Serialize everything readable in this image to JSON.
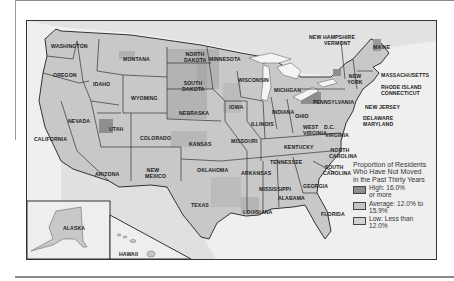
{
  "map": {
    "title": "Proportion of Residents Who Have Not Moved in the Past Thirty Years",
    "colors": {
      "water": "#f2f2f2",
      "land_outside": "#dcdcdc",
      "low": "#c8c8c8",
      "average": "#b4b4b4",
      "high": "#8e8e8e",
      "border": "#333333"
    },
    "states": [
      {
        "name": "WASHINGTON",
        "x": 50,
        "y": 43
      },
      {
        "name": "OREGON",
        "x": 52,
        "y": 71
      },
      {
        "name": "IDAHO",
        "x": 92,
        "y": 80
      },
      {
        "name": "MONTANA",
        "x": 122,
        "y": 55
      },
      {
        "name": "NORTH DAKOTA",
        "x": 183,
        "y": 50
      },
      {
        "name": "MINNESOTA",
        "x": 210,
        "y": 55
      },
      {
        "name": "SOUTH DAKOTA",
        "x": 182,
        "y": 79
      },
      {
        "name": "WYOMING",
        "x": 131,
        "y": 94
      },
      {
        "name": "NEBRASKA",
        "x": 178,
        "y": 109
      },
      {
        "name": "IOWA",
        "x": 228,
        "y": 103
      },
      {
        "name": "WISCONSIN",
        "x": 238,
        "y": 76
      },
      {
        "name": "MICHIGAN",
        "x": 274,
        "y": 86
      },
      {
        "name": "NEVADA",
        "x": 68,
        "y": 117
      },
      {
        "name": "UTAH",
        "x": 108,
        "y": 125
      },
      {
        "name": "COLORADO",
        "x": 140,
        "y": 134
      },
      {
        "name": "KANSAS",
        "x": 188,
        "y": 140
      },
      {
        "name": "MISSOURI",
        "x": 231,
        "y": 137
      },
      {
        "name": "ILLINOIS",
        "x": 250,
        "y": 120
      },
      {
        "name": "INDIANA",
        "x": 271,
        "y": 108
      },
      {
        "name": "OHIO",
        "x": 293,
        "y": 112
      },
      {
        "name": "PENNSYLVANIA",
        "x": 318,
        "y": 98
      },
      {
        "name": "NEW YORK",
        "x": 343,
        "y": 76
      },
      {
        "name": "WEST VIRGINIA",
        "x": 296,
        "y": 127
      },
      {
        "name": "VIRGINIA",
        "x": 315,
        "y": 131
      },
      {
        "name": "D.C.",
        "x": 318,
        "y": 124
      },
      {
        "name": "KENTUCKY",
        "x": 283,
        "y": 143
      },
      {
        "name": "CALIFORNIA",
        "x": 33,
        "y": 135
      },
      {
        "name": "ARIZONA",
        "x": 94,
        "y": 170
      },
      {
        "name": "NEW MEXICO",
        "x": 142,
        "y": 172
      },
      {
        "name": "OKLAHOMA",
        "x": 196,
        "y": 166
      },
      {
        "name": "ARKANSAS",
        "x": 239,
        "y": 169
      },
      {
        "name": "TENNESSEE",
        "x": 268,
        "y": 158
      },
      {
        "name": "NORTH CAROLINA",
        "x": 328,
        "y": 150
      },
      {
        "name": "SOUTH CAROLINA",
        "x": 322,
        "y": 167
      },
      {
        "name": "TEXAS",
        "x": 190,
        "y": 201
      },
      {
        "name": "MISSISSIPPI",
        "x": 257,
        "y": 185
      },
      {
        "name": "ALABAMA",
        "x": 277,
        "y": 194
      },
      {
        "name": "GEORGIA",
        "x": 302,
        "y": 182
      },
      {
        "name": "LOUISIANA",
        "x": 243,
        "y": 208
      },
      {
        "name": "FLORIDA",
        "x": 320,
        "y": 210
      },
      {
        "name": "ALASKA",
        "x": 62,
        "y": 224
      },
      {
        "name": "HAWAII",
        "x": 118,
        "y": 250
      }
    ],
    "callouts": [
      {
        "name": "NEW HAMPSHIRE",
        "x": 308,
        "y": 33
      },
      {
        "name": "VERMONT",
        "x": 323,
        "y": 39
      },
      {
        "name": "MAINE",
        "x": 375,
        "y": 43
      },
      {
        "name": "MASSACHUSETTS",
        "x": 381,
        "y": 71
      },
      {
        "name": "RHODE ISLAND",
        "x": 381,
        "y": 83
      },
      {
        "name": "CONNECTICUT",
        "x": 381,
        "y": 89
      },
      {
        "name": "NEW JERSEY",
        "x": 364,
        "y": 103
      },
      {
        "name": "DELAWARE",
        "x": 362,
        "y": 114
      },
      {
        "name": "MARYLAND",
        "x": 362,
        "y": 120
      }
    ]
  },
  "legend": {
    "title_lines": [
      "Proportion of Residents",
      "Who Have Not Moved",
      "in the Past Thirty Years"
    ],
    "items": [
      {
        "label_line1": "High: 16.0%",
        "label_line2": "or more",
        "color": "#8e8e8e"
      },
      {
        "label_line1": "Average:  12.0% to",
        "label_line2": "15.9%",
        "color": "#c4c4c4"
      },
      {
        "label_line1": "Low:  Less than",
        "label_line2": "12.0%",
        "color": "#d2d2d2"
      }
    ]
  }
}
